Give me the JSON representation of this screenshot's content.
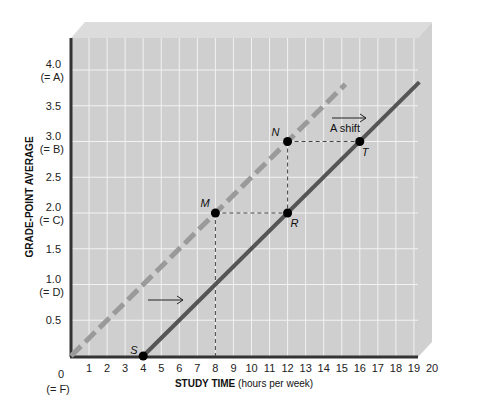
{
  "chart_data": {
    "type": "line",
    "title": "",
    "xlabel_bold": "STUDY TIME",
    "xlabel_rest": " (hours per week)",
    "ylabel": "GRADE-POINT AVERAGE",
    "xlim": [
      0,
      20
    ],
    "ylim": [
      0,
      4.0
    ],
    "x_ticks": [
      "1",
      "2",
      "3",
      "4",
      "5",
      "6",
      "7",
      "8",
      "9",
      "10",
      "11",
      "12",
      "13",
      "14",
      "15",
      "16",
      "17",
      "18",
      "19",
      "20"
    ],
    "x_origin_label": "0",
    "x_origin_sublabel": "(= F)",
    "y_ticks": [
      {
        "value": 0.5,
        "label": "0.5",
        "sub": ""
      },
      {
        "value": 1.0,
        "label": "1.0",
        "sub": "(= D)"
      },
      {
        "value": 1.5,
        "label": "1.5",
        "sub": ""
      },
      {
        "value": 2.0,
        "label": "2.0",
        "sub": "(= C)"
      },
      {
        "value": 2.5,
        "label": "2.5",
        "sub": ""
      },
      {
        "value": 3.0,
        "label": "3.0",
        "sub": "(= B)"
      },
      {
        "value": 3.5,
        "label": "3.5",
        "sub": ""
      },
      {
        "value": 4.0,
        "label": "4.0",
        "sub": "(= A)"
      }
    ],
    "grid": true,
    "series": [
      {
        "name": "Original relation",
        "style": "solid",
        "color": "#555555",
        "x": [
          4,
          19.3
        ],
        "y": [
          0,
          3.83
        ]
      },
      {
        "name": "Shifted relation",
        "style": "dashed",
        "color": "#9a9a9a",
        "x": [
          0,
          15.2
        ],
        "y": [
          0,
          3.8
        ]
      }
    ],
    "points": [
      {
        "label": "S",
        "x": 4,
        "y": 0
      },
      {
        "label": "M",
        "x": 8,
        "y": 2.0
      },
      {
        "label": "R",
        "x": 12,
        "y": 2.0
      },
      {
        "label": "N",
        "x": 12,
        "y": 3.0
      },
      {
        "label": "T",
        "x": 16,
        "y": 3.0
      }
    ],
    "annotations": [
      {
        "text": "A shift",
        "x": 15.2,
        "y": 3.25,
        "arrow": "right"
      },
      {
        "text": "",
        "x": 4.7,
        "y": 1.15,
        "arrow": "right"
      }
    ]
  }
}
